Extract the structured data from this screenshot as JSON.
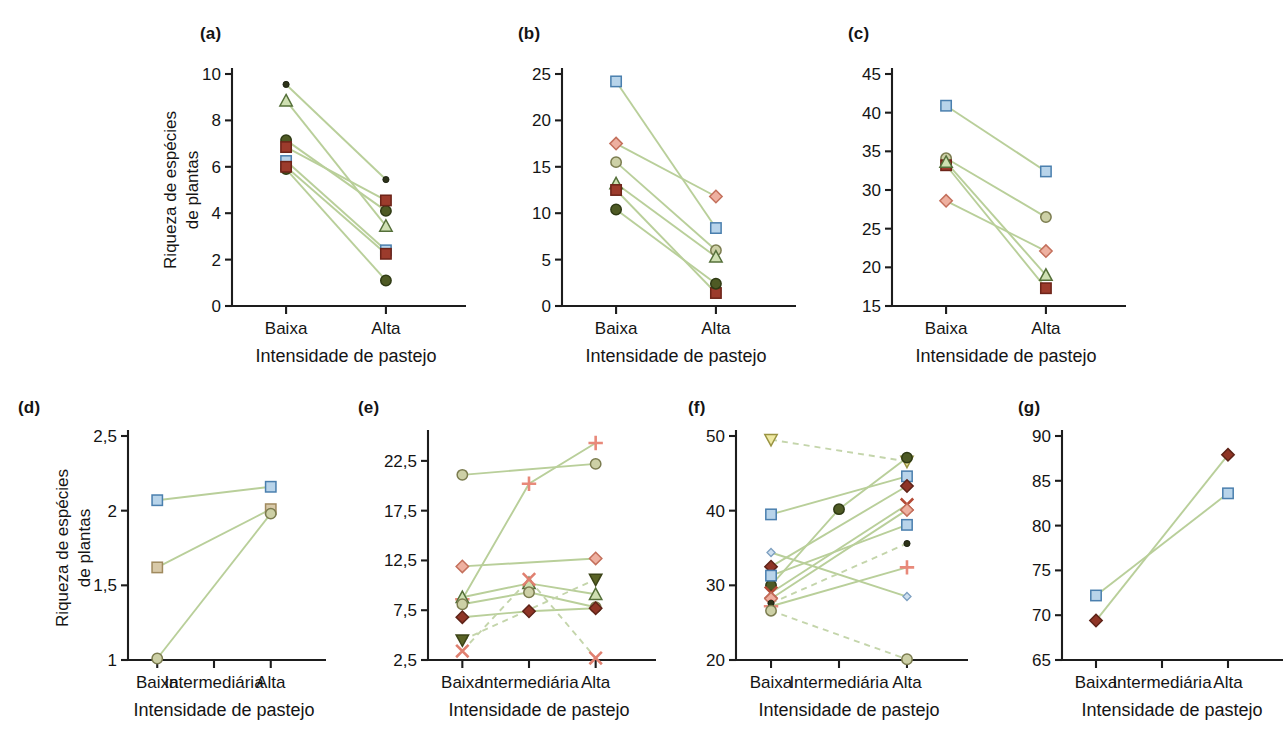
{
  "figure": {
    "axis_title": "Intensidade de pastejo",
    "y_axis_label_line1": "Riqueza de espécies",
    "y_axis_label_line2": "de plantas",
    "categories_two": [
      "Baixa",
      "Alta"
    ],
    "categories_three": [
      "Baixa",
      "Intermediária",
      "Alta"
    ],
    "colors": {
      "connector": "#b9cf9a",
      "connector_dashed": "#c4d5ab",
      "axis": "#1d1d1d",
      "blue_square": "#b8d4ea",
      "blue_square_edge": "#4a7fae",
      "dark_red_square": "#9c3b2c",
      "dark_red_edge": "#6d2419",
      "salmon_diamond": "#eeb0a0",
      "salmon_edge": "#c4705c",
      "dark_red_diamond": "#8f3526",
      "olive_circle": "#cdd0a6",
      "olive_edge": "#7b7c4f",
      "dark_olive_circle": "#4e5a24",
      "dark_dot": "#2d3319",
      "green_triangle": "#cfe0b2",
      "green_triangle_edge": "#55703a",
      "olive_triangle_down": "#5a6326",
      "yellow_triangle_down": "#efe9a3",
      "salmon_plus": "#e8897a",
      "salmon_x": "#e08070",
      "dark_red_x": "#b34a36",
      "pale_blue_diamond": "#cfe0f0",
      "tan_square": "#d8c9a8"
    }
  },
  "chart_data": [
    {
      "id": "a",
      "type": "line",
      "panel_label": "(a)",
      "title": "",
      "xlabel": "Intensidade de pastejo",
      "ylabel": "Riqueza de espécies de plantas",
      "categories": [
        "Baixa",
        "Alta"
      ],
      "ylim": [
        0,
        10
      ],
      "yticks": [
        0,
        2,
        4,
        6,
        8,
        10
      ],
      "ytick_labels": [
        "0",
        "2",
        "4",
        "6",
        "8",
        "10"
      ],
      "grid": false,
      "legend": "none",
      "series": [
        {
          "name": "s1",
          "marker": "dot-small",
          "color": "dark_dot",
          "values": [
            9.55,
            5.45
          ]
        },
        {
          "name": "s2",
          "marker": "triangle",
          "color": "green_triangle",
          "values": [
            8.85,
            3.45
          ]
        },
        {
          "name": "s3",
          "marker": "circle",
          "color": "dark_olive_circle",
          "values": [
            7.15,
            4.1
          ]
        },
        {
          "name": "s4",
          "marker": "square",
          "color": "dark_red_square",
          "values": [
            6.85,
            4.55
          ]
        },
        {
          "name": "s5",
          "marker": "square",
          "color": "blue_square",
          "values": [
            6.25,
            2.4
          ]
        },
        {
          "name": "s6",
          "marker": "circle",
          "color": "dark_olive_circle",
          "values": [
            5.9,
            1.1
          ]
        },
        {
          "name": "s7",
          "marker": "square",
          "color": "dark_red_square",
          "values": [
            6.0,
            2.25
          ]
        }
      ]
    },
    {
      "id": "b",
      "type": "line",
      "panel_label": "(b)",
      "xlabel": "Intensidade de pastejo",
      "categories": [
        "Baixa",
        "Alta"
      ],
      "ylim": [
        0,
        25
      ],
      "yticks": [
        0,
        5,
        10,
        15,
        20,
        25
      ],
      "ytick_labels": [
        "0",
        "5",
        "10",
        "15",
        "20",
        "25"
      ],
      "grid": false,
      "legend": "none",
      "series": [
        {
          "name": "s1",
          "marker": "square",
          "color": "blue_square",
          "values": [
            24.2,
            8.4
          ]
        },
        {
          "name": "s2",
          "marker": "diamond",
          "color": "salmon_diamond",
          "values": [
            17.5,
            11.8
          ]
        },
        {
          "name": "s3",
          "marker": "circle",
          "color": "olive_circle",
          "values": [
            15.5,
            6.0
          ]
        },
        {
          "name": "s4",
          "marker": "triangle",
          "color": "green_triangle",
          "values": [
            13.2,
            5.3
          ]
        },
        {
          "name": "s5",
          "marker": "square",
          "color": "dark_red_square",
          "values": [
            12.5,
            1.4
          ]
        },
        {
          "name": "s6",
          "marker": "circle",
          "color": "dark_olive_circle",
          "values": [
            10.4,
            2.4
          ]
        }
      ]
    },
    {
      "id": "c",
      "type": "line",
      "panel_label": "(c)",
      "xlabel": "Intensidade de pastejo",
      "categories": [
        "Baixa",
        "Alta"
      ],
      "ylim": [
        15,
        45
      ],
      "yticks": [
        15,
        20,
        25,
        30,
        35,
        40,
        45
      ],
      "ytick_labels": [
        "15",
        "20",
        "25",
        "30",
        "35",
        "40",
        "45"
      ],
      "grid": false,
      "legend": "none",
      "series": [
        {
          "name": "s1",
          "marker": "square",
          "color": "blue_square",
          "values": [
            40.9,
            32.4
          ]
        },
        {
          "name": "s2",
          "marker": "circle",
          "color": "olive_circle",
          "values": [
            34.1,
            26.5
          ]
        },
        {
          "name": "s3",
          "marker": "square",
          "color": "dark_red_square",
          "values": [
            33.2,
            17.3
          ]
        },
        {
          "name": "s4",
          "marker": "triangle",
          "color": "green_triangle",
          "values": [
            33.6,
            19.0
          ]
        },
        {
          "name": "s5",
          "marker": "diamond",
          "color": "salmon_diamond",
          "values": [
            28.6,
            22.1
          ]
        }
      ]
    },
    {
      "id": "d",
      "type": "line",
      "panel_label": "(d)",
      "xlabel": "Intensidade de pastejo",
      "ylabel": "Riqueza de espécies de plantas",
      "categories": [
        "Baixa",
        "Intermediária",
        "Alta"
      ],
      "ylim": [
        1,
        2.5
      ],
      "yticks": [
        1,
        1.5,
        2,
        2.5
      ],
      "ytick_labels": [
        "1",
        "1,5",
        "2",
        "2,5"
      ],
      "grid": false,
      "legend": "none",
      "series": [
        {
          "name": "s1",
          "marker": "square",
          "color": "blue_square",
          "values": [
            2.07,
            null,
            2.16
          ]
        },
        {
          "name": "s2",
          "marker": "square",
          "color": "tan_square",
          "values": [
            1.62,
            null,
            2.01
          ]
        },
        {
          "name": "s3",
          "marker": "circle",
          "color": "olive_circle",
          "values": [
            1.01,
            null,
            1.98
          ]
        }
      ]
    },
    {
      "id": "e",
      "type": "line",
      "panel_label": "(e)",
      "xlabel": "Intensidade de pastejo",
      "categories": [
        "Baixa",
        "Intermediária",
        "Alta"
      ],
      "ylim": [
        2.5,
        25.0
      ],
      "yticks": [
        2.5,
        7.5,
        12.5,
        17.5,
        22.5
      ],
      "ytick_labels": [
        "2,5",
        "7,5",
        "12,5",
        "17,5",
        "22,5"
      ],
      "grid": false,
      "legend": "none",
      "series": [
        {
          "name": "s1",
          "marker": "circle",
          "color": "olive_circle",
          "values": [
            21.1,
            null,
            22.2
          ],
          "dashed": false
        },
        {
          "name": "s2",
          "marker": "plus",
          "color": "salmon_plus",
          "values": [
            8.6,
            20.2,
            24.3
          ],
          "dashed": false
        },
        {
          "name": "s3",
          "marker": "diamond",
          "color": "salmon_diamond",
          "values": [
            11.9,
            null,
            12.7
          ],
          "dashed": false
        },
        {
          "name": "s4",
          "marker": "triangle",
          "color": "green_triangle",
          "values": [
            8.8,
            10.2,
            9.1
          ],
          "dashed": false
        },
        {
          "name": "s5",
          "marker": "circle",
          "color": "olive_circle",
          "values": [
            8.1,
            9.3,
            7.8
          ],
          "dashed": false
        },
        {
          "name": "s6",
          "marker": "diamond",
          "color": "dark_red_diamond",
          "values": [
            6.8,
            7.4,
            7.7
          ],
          "dashed": false
        },
        {
          "name": "s7",
          "marker": "triangle-down",
          "color": "olive_triangle_down",
          "values": [
            4.5,
            null,
            10.6
          ],
          "dashed": true
        },
        {
          "name": "s8",
          "marker": "x",
          "color": "salmon_x",
          "values": [
            3.4,
            10.6,
            2.7
          ],
          "dashed": true
        }
      ]
    },
    {
      "id": "f",
      "type": "line",
      "panel_label": "(f)",
      "xlabel": "Intensidade de pastejo",
      "categories": [
        "Baixa",
        "Intermediária",
        "Alta"
      ],
      "ylim": [
        20,
        50
      ],
      "yticks": [
        20,
        30,
        40,
        50
      ],
      "ytick_labels": [
        "20",
        "30",
        "40",
        "50"
      ],
      "grid": false,
      "legend": "none",
      "series": [
        {
          "name": "s1",
          "marker": "triangle-down",
          "color": "yellow_triangle_down",
          "values": [
            49.5,
            null,
            46.6
          ],
          "dashed": true
        },
        {
          "name": "s2",
          "marker": "square",
          "color": "blue_square",
          "values": [
            39.5,
            null,
            44.6
          ],
          "dashed": false
        },
        {
          "name": "s3",
          "marker": "circle",
          "color": "dark_olive_circle",
          "values": [
            30.0,
            40.2,
            47.1
          ],
          "dashed": false
        },
        {
          "name": "s4",
          "marker": "diamond-small",
          "color": "pale_blue_diamond",
          "values": [
            34.4,
            null,
            28.5
          ],
          "dashed": false
        },
        {
          "name": "s5",
          "marker": "diamond",
          "color": "dark_red_diamond",
          "values": [
            32.5,
            null,
            43.3
          ],
          "dashed": false
        },
        {
          "name": "s6",
          "marker": "square",
          "color": "blue_square",
          "values": [
            31.3,
            null,
            38.1
          ],
          "dashed": false
        },
        {
          "name": "s7",
          "marker": "x",
          "color": "dark_red_x",
          "values": [
            29.0,
            null,
            40.8
          ],
          "dashed": false
        },
        {
          "name": "s8",
          "marker": "diamond",
          "color": "salmon_diamond",
          "values": [
            28.2,
            null,
            40.1
          ],
          "dashed": false
        },
        {
          "name": "s9",
          "marker": "plus",
          "color": "salmon_plus",
          "values": [
            27.2,
            null,
            32.4
          ],
          "dashed": false
        },
        {
          "name": "s10",
          "marker": "dot-small",
          "color": "dark_dot",
          "values": [
            27.6,
            null,
            35.6
          ],
          "dashed": true
        },
        {
          "name": "s11",
          "marker": "circle",
          "color": "olive_circle",
          "values": [
            26.6,
            null,
            20.1
          ],
          "dashed": true
        }
      ]
    },
    {
      "id": "g",
      "type": "line",
      "panel_label": "(g)",
      "xlabel": "Intensidade de pastejo",
      "categories": [
        "Baixa",
        "Intermediária",
        "Alta"
      ],
      "ylim": [
        65,
        90
      ],
      "yticks": [
        65,
        70,
        75,
        80,
        85,
        90
      ],
      "ytick_labels": [
        "65",
        "70",
        "75",
        "80",
        "85",
        "90"
      ],
      "grid": false,
      "legend": "none",
      "series": [
        {
          "name": "s1",
          "marker": "square",
          "color": "blue_square",
          "values": [
            72.2,
            null,
            83.6
          ]
        },
        {
          "name": "s2",
          "marker": "diamond",
          "color": "dark_red_diamond",
          "values": [
            69.4,
            null,
            87.9
          ]
        }
      ]
    }
  ]
}
